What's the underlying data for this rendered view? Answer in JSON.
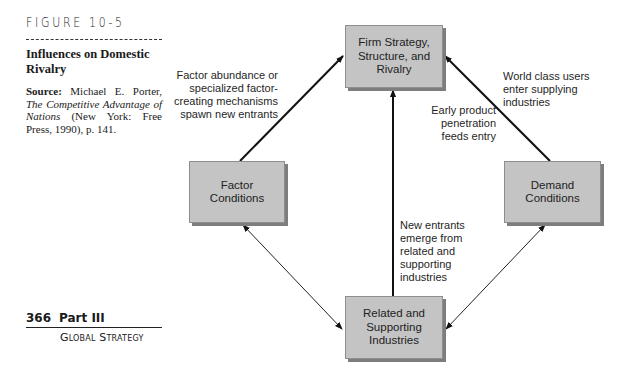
{
  "figure": {
    "label": "FIGURE 10-5",
    "title": "Influences on Domestic Rivalry",
    "source_label": "Source:",
    "source_author": "Michael E. Porter,",
    "source_work": "The Competitive Advantage of Nations",
    "source_pub": "(New York: Free Press, 1990), p. 141."
  },
  "page": {
    "number": "366",
    "part": "Part III",
    "section": "Global Strategy"
  },
  "diagram": {
    "nodes": {
      "firm": "Firm Strategy, Structure, and Rivalry",
      "factor": "Factor Conditions",
      "demand": "Demand Conditions",
      "related": "Related and Supporting Industries"
    },
    "annotations": {
      "factor_to_firm": "Factor abundance or specialized factor-creating mechanisms spawn new entrants",
      "demand_to_firm": "World class users enter supplying industries",
      "early_product": "Early product penetration feeds entry",
      "related_to_firm": "New entrants emerge from related and supporting industries"
    },
    "edges": [
      {
        "from": "factor",
        "to": "firm",
        "direction": "one-way"
      },
      {
        "from": "demand",
        "to": "firm",
        "direction": "one-way"
      },
      {
        "from": "related",
        "to": "firm",
        "direction": "one-way"
      },
      {
        "from": "factor",
        "to": "related",
        "direction": "two-way"
      },
      {
        "from": "demand",
        "to": "related",
        "direction": "two-way"
      }
    ]
  }
}
